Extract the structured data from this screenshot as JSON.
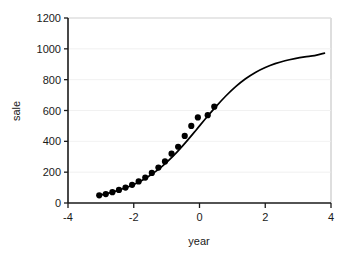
{
  "chart_data": {
    "type": "line",
    "title": "",
    "xlabel": "year",
    "ylabel": "sale",
    "xlim": [
      -4,
      4
    ],
    "ylim": [
      0,
      1200
    ],
    "xticks": [
      -4,
      -2,
      0,
      2,
      4
    ],
    "xticklabels": [
      "-4",
      "-2",
      "0",
      "2",
      "4"
    ],
    "yticks": [
      0,
      200,
      400,
      600,
      800,
      1000,
      1200
    ],
    "yticklabels": [
      "0",
      "200",
      "400",
      "600",
      "800",
      "1000",
      "1200"
    ],
    "grid": true,
    "grid_axis": "y",
    "legend": false,
    "series": [
      {
        "name": "fitted logistic curve",
        "type": "line",
        "color": "#000000",
        "x": [
          -3.05,
          -2.8,
          -2.5,
          -2.2,
          -1.9,
          -1.6,
          -1.3,
          -1.0,
          -0.7,
          -0.4,
          -0.1,
          0.2,
          0.5,
          0.8,
          1.1,
          1.4,
          1.7,
          2.0,
          2.3,
          2.6,
          2.9,
          3.2,
          3.5,
          3.8
        ],
        "y": [
          50,
          62,
          80,
          102,
          130,
          166,
          210,
          264,
          327,
          398,
          474,
          551,
          625,
          694,
          755,
          806,
          847,
          879,
          904,
          923,
          937,
          948,
          956,
          972
        ]
      },
      {
        "name": "observed sales",
        "type": "scatter",
        "color": "#000000",
        "marker": "filled-circle",
        "x": [
          -3.05,
          -2.85,
          -2.65,
          -2.45,
          -2.25,
          -2.05,
          -1.85,
          -1.65,
          -1.45,
          -1.25,
          -1.05,
          -0.85,
          -0.65,
          -0.45,
          -0.25,
          -0.05,
          0.25,
          0.45
        ],
        "y": [
          50,
          58,
          70,
          85,
          100,
          118,
          140,
          165,
          195,
          230,
          270,
          320,
          365,
          435,
          500,
          555,
          570,
          625
        ]
      }
    ]
  },
  "axes": {
    "x_title": "year",
    "y_title": "sale"
  }
}
